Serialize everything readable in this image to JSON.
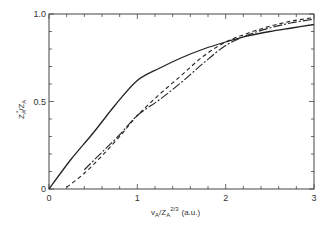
{
  "chart_data": {
    "type": "line",
    "title": "",
    "xlabel": "v_A / Z_A^{2/3} (a.u.)",
    "ylabel": "Z_A* / Z_A",
    "xlim": [
      0,
      3
    ],
    "ylim": [
      0,
      1.0
    ],
    "x_ticks": [
      "0",
      "1",
      "2",
      "3"
    ],
    "y_ticks": [
      "0",
      "0.5",
      "1.0"
    ],
    "grid": false,
    "legend": null,
    "series": [
      {
        "name": "solid",
        "style": "solid",
        "x": [
          0,
          0.25,
          0.5,
          0.75,
          1.0,
          1.25,
          1.5,
          1.75,
          2.0,
          2.25,
          2.5,
          2.75,
          3.0
        ],
        "y": [
          0,
          0.17,
          0.32,
          0.48,
          0.62,
          0.69,
          0.75,
          0.8,
          0.84,
          0.875,
          0.9,
          0.92,
          0.94
        ]
      },
      {
        "name": "long-dash",
        "style": "long-dash",
        "x": [
          0.4,
          0.6,
          0.8,
          1.0,
          1.25,
          1.5,
          1.75,
          2.0,
          2.25,
          2.5,
          2.75,
          3.0
        ],
        "y": [
          0.11,
          0.21,
          0.31,
          0.42,
          0.51,
          0.61,
          0.72,
          0.82,
          0.88,
          0.92,
          0.95,
          0.97
        ]
      },
      {
        "name": "short-dash",
        "style": "short-dash",
        "x": [
          0.2,
          0.4,
          0.6,
          0.8,
          1.0,
          1.25,
          1.5,
          1.75,
          2.0,
          2.25,
          2.5,
          2.75,
          3.0
        ],
        "y": [
          0.01,
          0.09,
          0.19,
          0.3,
          0.42,
          0.54,
          0.65,
          0.76,
          0.84,
          0.89,
          0.93,
          0.96,
          0.98
        ]
      }
    ]
  },
  "axes": {
    "x_label_main": "v",
    "x_label_sub": "A",
    "x_label_slash": "/Z",
    "x_label_sub2": "A",
    "x_label_sup": "2/3",
    "x_label_units": "(a.u.)",
    "y_label": "Zₐ* / Zₐ",
    "y_label_main": "Z",
    "y_label_sub": "A",
    "y_label_star": "*",
    "y_label_slash": "/Z",
    "y_label_sub2": "A",
    "x_tick_labels": [
      "0",
      "1",
      "2",
      "3"
    ],
    "y_tick_labels": [
      "0",
      "0.5",
      "1.0"
    ]
  }
}
